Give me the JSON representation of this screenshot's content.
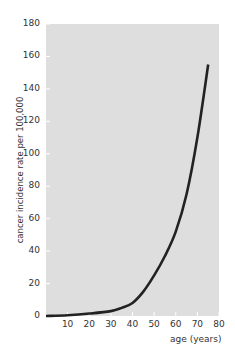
{
  "chart_data": {
    "type": "line",
    "title": "",
    "xlabel": "age (years)",
    "ylabel": "cancer incidence rate per 100,000",
    "xlim": [
      0,
      80
    ],
    "ylim": [
      0,
      180
    ],
    "x_ticks": [
      "10",
      "20",
      "30",
      "40",
      "50",
      "60",
      "70",
      "80"
    ],
    "y_ticks": [
      "0",
      "20",
      "40",
      "60",
      "80",
      "100",
      "120",
      "140",
      "160",
      "180"
    ],
    "grid": false,
    "series": [
      {
        "name": "cancer incidence",
        "x": [
          0,
          10,
          20,
          30,
          35,
          40,
          45,
          50,
          55,
          60,
          65,
          70,
          75
        ],
        "values": [
          0,
          0.5,
          1.5,
          3,
          5,
          8,
          15,
          25,
          37,
          52,
          75,
          110,
          155
        ]
      }
    ],
    "colors": {
      "background": "#dedede",
      "line": "#222222"
    }
  },
  "axis": {
    "x_title": "age (years)",
    "y_title": "cancer incidence rate per 100,000",
    "zero_label": "0"
  }
}
